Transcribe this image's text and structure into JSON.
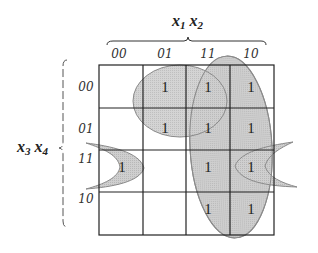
{
  "diagram": {
    "type": "karnaugh_map",
    "column_variables": {
      "main": "x",
      "sub1": "1",
      "sep": " ",
      "main2": "x",
      "sub2": "2"
    },
    "row_variables": {
      "main": "x",
      "sub1": "3",
      "sep": " ",
      "main2": "x",
      "sub2": "4"
    },
    "column_labels": [
      "00",
      "01",
      "11",
      "10"
    ],
    "row_labels": [
      "00",
      "01",
      "11",
      "10"
    ],
    "cells": [
      [
        "",
        "1",
        "1",
        "1"
      ],
      [
        "",
        "1",
        "1",
        "1"
      ],
      [
        "1",
        "",
        "1",
        "1"
      ],
      [
        "",
        "",
        "1",
        "1"
      ]
    ],
    "groupings": [
      {
        "name": "group-x2-x3bar",
        "description": "columns 01 & 11, rows 00 & 01"
      },
      {
        "name": "group-x1",
        "description": "columns 11 & 10, all rows"
      },
      {
        "name": "group-x2bar-x3-x4",
        "description": "columns 00 & 10, row 11 (wraparound)"
      }
    ],
    "colors": {
      "group_fill": "#c8c8c8",
      "group_stroke": "#8a8a8a",
      "grid": "#222222"
    }
  }
}
